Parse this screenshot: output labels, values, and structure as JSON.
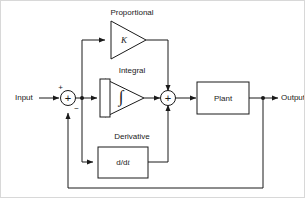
{
  "diagram": {
    "type": "control-system-block-diagram",
    "colors": {
      "line": "#1a1a1a",
      "background": "#ffffff",
      "frame": "#d8d8d8"
    },
    "io": {
      "input_label": "Input",
      "output_label": "Output"
    },
    "summing_junctions": [
      {
        "name": "error-sum",
        "symbol": "+",
        "signs": [
          "+",
          "−"
        ],
        "plus_sign": "+",
        "minus_sign": "−"
      },
      {
        "name": "control-sum",
        "symbol": "+",
        "signs": [
          "+",
          "+",
          "+"
        ]
      }
    ],
    "branches": [
      {
        "name": "proportional",
        "title": "Proportional",
        "shape": "triangle",
        "symbol": "K"
      },
      {
        "name": "integral",
        "title": "Integral",
        "shape": "triangle-with-bar",
        "symbol": "∫"
      },
      {
        "name": "derivative",
        "title": "Derivative",
        "shape": "rectangle",
        "symbol": "d/dt",
        "symbol_prefix": "d/d",
        "symbol_suffix": "t"
      }
    ],
    "plant": {
      "name": "plant",
      "label": "Plant",
      "shape": "rectangle"
    },
    "feedback": {
      "name": "feedback-path",
      "description": "output tapped and returned to negative input of error sum"
    }
  }
}
